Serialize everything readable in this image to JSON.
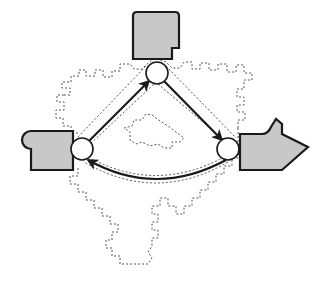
{
  "canvas": {
    "width": 318,
    "height": 284,
    "background": "#ffffff",
    "title": "Abstract process flow diagram with three nodes and three filled block shapes"
  },
  "style": {
    "fill_gray": "#c8c8c8",
    "stroke_dark": "#1a1a1a",
    "stroke_dashed": "#555555",
    "node_fill": "#ffffff",
    "arrow_stroke": "#1a1a1a",
    "solid_stroke_width": 2.2,
    "dashed_stroke_width": 1.0,
    "dash_pattern": "2,2"
  },
  "nodes": [
    {
      "id": "node-top",
      "label": "",
      "cx": 157,
      "cy": 73,
      "r": 11,
      "fill": "#ffffff",
      "stroke": "#1a1a1a"
    },
    {
      "id": "node-left",
      "label": "",
      "cx": 82,
      "cy": 149,
      "r": 11,
      "fill": "#ffffff",
      "stroke": "#1a1a1a"
    },
    {
      "id": "node-right",
      "label": "",
      "cx": 228,
      "cy": 149,
      "r": 11,
      "fill": "#ffffff",
      "stroke": "#1a1a1a"
    }
  ],
  "blocks": [
    {
      "id": "block-top",
      "name": "top-gray-block",
      "shape": "rounded-top-rectangle-with-notch",
      "x": 130,
      "y": 12,
      "width": 52,
      "height": 48,
      "fill": "#c8c8c8",
      "stroke": "#1a1a1a"
    },
    {
      "id": "block-left",
      "name": "left-gray-block",
      "shape": "rectangle-with-circular-tab",
      "x": 22,
      "y": 131,
      "width": 51,
      "height": 39,
      "fill": "#c8c8c8",
      "stroke": "#1a1a1a"
    },
    {
      "id": "block-right",
      "name": "right-gray-arrow-block",
      "shape": "right-pointing-arrow-with-notch",
      "x": 238,
      "y": 120,
      "width": 70,
      "height": 50,
      "fill": "#c8c8c8",
      "stroke": "#1a1a1a"
    }
  ],
  "edges": [
    {
      "id": "edge-left-to-top",
      "from": "node-left",
      "to": "node-top",
      "style": "solid",
      "arrowhead": "to",
      "shape": "straight"
    },
    {
      "id": "edge-top-to-right",
      "from": "node-top",
      "to": "node-right",
      "style": "solid",
      "arrowhead": "to",
      "shape": "straight"
    },
    {
      "id": "edge-right-to-left",
      "from": "node-right",
      "to": "node-left",
      "style": "solid",
      "arrowhead": "to",
      "shape": "curved"
    }
  ],
  "dashed_regions": [
    {
      "id": "outer-boundary",
      "name": "outer-dashed-boundary",
      "description": "Large irregular jagged dashed outline enclosing the whole node triangle with a narrow tail extending downward"
    },
    {
      "id": "inner-island",
      "name": "inner-dashed-island",
      "description": "Small irregular dashed polygon inside the triangle"
    },
    {
      "id": "edge-corridors",
      "name": "dashed-edge-corridors",
      "description": "Thin dashed corridors running parallel to each of the three arrows"
    }
  ]
}
